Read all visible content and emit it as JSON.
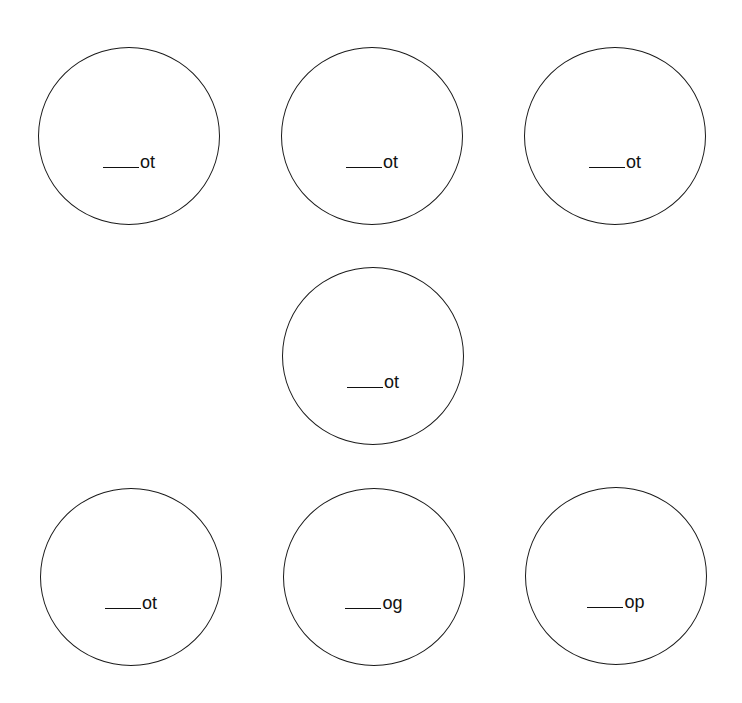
{
  "worksheet": {
    "blank_placeholder": "____",
    "items": [
      {
        "ending": "ot"
      },
      {
        "ending": "ot"
      },
      {
        "ending": "ot"
      },
      {
        "ending": "ot"
      },
      {
        "ending": "ot"
      },
      {
        "ending": "og"
      },
      {
        "ending": "op"
      }
    ]
  }
}
